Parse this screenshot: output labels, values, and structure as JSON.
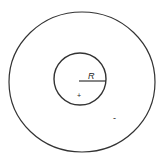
{
  "diagram": {
    "outer_circle": {
      "cx": 82,
      "cy": 82,
      "rx": 73,
      "ry": 70
    },
    "inner_circle": {
      "cx": 80,
      "cy": 79,
      "r": 26
    },
    "radius_label": "R",
    "inner_charge_sign": "+",
    "outer_charge_sign": "-",
    "stroke_color": "#333333"
  }
}
